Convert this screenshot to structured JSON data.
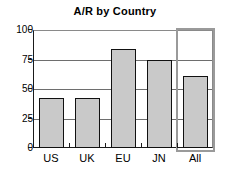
{
  "chart_data": {
    "type": "bar",
    "title": "A/R by Country",
    "xlabel": "",
    "ylabel": "",
    "categories": [
      "US",
      "UK",
      "EU",
      "JN",
      "All"
    ],
    "values": [
      42,
      42,
      84,
      75,
      61
    ],
    "ylim": [
      0,
      100
    ],
    "yticks": [
      0,
      25,
      50,
      75,
      100
    ],
    "ytick_labels": [
      "0",
      "25",
      "50",
      "75",
      "100"
    ],
    "grid": true,
    "legend": false,
    "bar_color": "#c9c9c9",
    "bar_edge_color": "#111111",
    "axis_color": "#1a1a1a",
    "grid_color": "#6e6e6e",
    "background": "#ffffff",
    "selection": {
      "category": "All",
      "color": "#9a9a9a"
    }
  }
}
